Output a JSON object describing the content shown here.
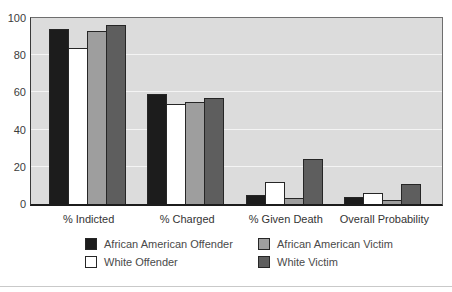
{
  "chart_data": {
    "type": "bar",
    "title": "",
    "xlabel": "",
    "ylabel": "",
    "categories": [
      "% Indicted",
      "% Charged",
      "% Given Death",
      "Overall Probability"
    ],
    "series": [
      {
        "name": "African American Offender",
        "color": "#1c1c1c",
        "values": [
          94,
          59,
          5,
          4
        ]
      },
      {
        "name": "White Offender",
        "color": "#ffffff",
        "values": [
          84,
          54,
          12,
          6
        ]
      },
      {
        "name": "African American Victim",
        "color": "#9e9e9e",
        "values": [
          93,
          55,
          3,
          2
        ]
      },
      {
        "name": "White Victim",
        "color": "#5e5e5e",
        "values": [
          96,
          57,
          24,
          11
        ]
      }
    ],
    "ylim": [
      0,
      100
    ],
    "yticks": [
      0,
      20,
      40,
      60,
      80,
      100
    ],
    "grid": true,
    "legend_position": "bottom",
    "plot_background": "#dcdcdc",
    "gridline_color": "#f4f4f4"
  }
}
